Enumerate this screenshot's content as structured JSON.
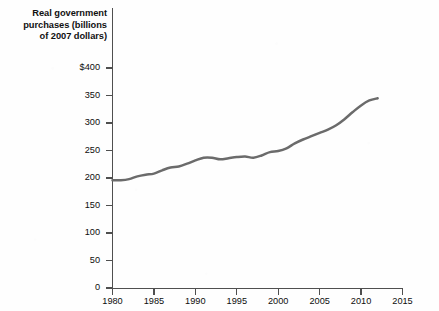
{
  "chart_data": {
    "type": "line",
    "title": "Real government purchases (billions of 2007 dollars)",
    "title_lines": [
      "Real government",
      "purchases (billions",
      "of 2007 dollars)"
    ],
    "xlabel": "",
    "ylabel": "",
    "xlim": [
      1980,
      2015
    ],
    "ylim": [
      0,
      400
    ],
    "grid": false,
    "legend": false,
    "line_color": "#6b6b6b",
    "axis_color": "#4f4f4f",
    "y_ticks": [
      0,
      50,
      100,
      150,
      200,
      250,
      300,
      350,
      400
    ],
    "y_tick_labels": [
      "0",
      "50",
      "100",
      "150",
      "200",
      "250",
      "300",
      "350",
      "$400"
    ],
    "x_ticks": [
      1980,
      1985,
      1990,
      1995,
      2000,
      2005,
      2010,
      2015
    ],
    "x_tick_labels": [
      "1980",
      "1985",
      "1990",
      "1995",
      "2000",
      "2005",
      "2010",
      "2015"
    ],
    "x": [
      1980,
      1981,
      1982,
      1983,
      1984,
      1985,
      1986,
      1987,
      1988,
      1989,
      1990,
      1991,
      1992,
      1993,
      1994,
      1995,
      1996,
      1997,
      1998,
      1999,
      2000,
      2001,
      2002,
      2003,
      2004,
      2005,
      2006,
      2007,
      2008,
      2009,
      2010,
      2011,
      2012
    ],
    "values": [
      196,
      196,
      198,
      203,
      206,
      208,
      214,
      219,
      221,
      226,
      232,
      237,
      237,
      234,
      236,
      238,
      239,
      237,
      241,
      247,
      249,
      254,
      263,
      270,
      276,
      282,
      288,
      296,
      307,
      320,
      332,
      341,
      345
    ],
    "series": [
      {
        "name": "Real government purchases",
        "values": [
          196,
          196,
          198,
          203,
          206,
          208,
          214,
          219,
          221,
          226,
          232,
          237,
          237,
          234,
          236,
          238,
          239,
          237,
          241,
          247,
          249,
          254,
          263,
          270,
          276,
          282,
          288,
          296,
          307,
          320,
          332,
          341,
          345
        ]
      }
    ]
  }
}
